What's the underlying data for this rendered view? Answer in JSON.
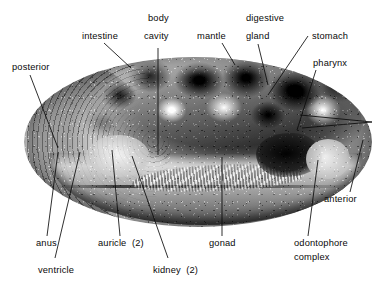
{
  "figure": {
    "kind": "anatomical-photograph",
    "orientation_note": "posterior at left, anterior at right",
    "colors": {
      "background": "#ffffff",
      "label_text": "#0a0a0a",
      "leader_line": "#0b0b0b"
    }
  },
  "labels": [
    {
      "id": "posterior",
      "text": "posterior",
      "lines": [
        "posterior"
      ]
    },
    {
      "id": "intestine",
      "text": "intestine",
      "lines": [
        "intestine"
      ]
    },
    {
      "id": "body-cavity",
      "text": "body cavity",
      "lines": [
        "body",
        "cavity"
      ]
    },
    {
      "id": "mantle",
      "text": "mantle",
      "lines": [
        "mantle"
      ]
    },
    {
      "id": "digestive-gland",
      "text": "digestive gland",
      "lines": [
        "digestive",
        "gland"
      ]
    },
    {
      "id": "stomach",
      "text": "stomach",
      "lines": [
        "stomach"
      ]
    },
    {
      "id": "pharynx",
      "text": "pharynx",
      "lines": [
        "pharynx"
      ]
    },
    {
      "id": "anterior",
      "text": "anterior",
      "lines": [
        "anterior"
      ]
    },
    {
      "id": "odontophore-complex",
      "text": "odontophore complex",
      "lines": [
        "odontophore",
        "complex"
      ]
    },
    {
      "id": "gonad",
      "text": "gonad",
      "lines": [
        "gonad"
      ]
    },
    {
      "id": "kidney",
      "text": "kidney (2)",
      "lines": [
        "kidney  (2)"
      ]
    },
    {
      "id": "auricle",
      "text": "auricle (2)",
      "lines": [
        "auricle  (2)"
      ]
    },
    {
      "id": "ventricle",
      "text": "ventricle",
      "lines": [
        "ventricle"
      ]
    },
    {
      "id": "anus",
      "text": "anus",
      "lines": [
        "anus"
      ]
    }
  ]
}
